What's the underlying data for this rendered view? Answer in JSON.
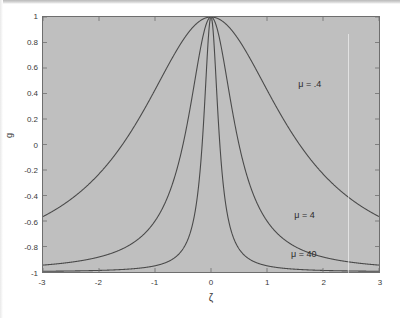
{
  "figure": {
    "background_color": "#ffffff",
    "plot_fill_color": "#bfbfbf",
    "curve_color": "#4a4a4a",
    "axis_color": "#6e6e6e",
    "text_color": "#3a3a3a"
  },
  "chart_data": {
    "type": "line",
    "title": "",
    "subtitle": "",
    "xlabel": "ζ",
    "ylabel": "g",
    "xlim": [
      -3,
      3
    ],
    "ylim": [
      -1,
      1
    ],
    "grid": false,
    "legend_position": "inline-annotations",
    "x_ticks": [
      "-3",
      "-2",
      "-1",
      "0",
      "1",
      "2",
      "3"
    ],
    "x_tick_values": [
      -3,
      -2,
      -1,
      0,
      1,
      2,
      3
    ],
    "y_ticks": [
      "1",
      "0.8",
      "0.6",
      "0.4",
      "0.2",
      "0",
      "-0.2",
      "-0.4",
      "-0.6",
      "-0.8",
      "-1"
    ],
    "y_tick_values": [
      1,
      0.8,
      0.6,
      0.4,
      0.2,
      0,
      -0.2,
      -0.4,
      -0.6,
      -0.8,
      -1
    ],
    "shaded_region": {
      "description": "Grey filled background spanning full axes between g = -1 and g = 1",
      "y_from": -1,
      "y_to": 1
    },
    "annotations": [
      {
        "text": "μ = .4",
        "x": 1.55,
        "y": 0.46
      },
      {
        "text": "μ = 4",
        "x": 1.48,
        "y": -0.56
      },
      {
        "text": "μ = 40",
        "x": 1.42,
        "y": -0.86
      }
    ],
    "formula": "g(ζ) = 2 / (1 + μζ²) − 1",
    "series": [
      {
        "name": "μ = .4",
        "mu": 0.4,
        "x": [
          -3,
          -2.75,
          -2.5,
          -2.25,
          -2,
          -1.75,
          -1.5,
          -1.25,
          -1,
          -0.75,
          -0.5,
          -0.25,
          0,
          0.25,
          0.5,
          0.75,
          1,
          1.25,
          1.5,
          1.75,
          2,
          2.25,
          2.5,
          2.75,
          3
        ],
        "values": [
          0.127,
          0.177,
          0.231,
          0.292,
          0.429,
          0.448,
          0.525,
          0.6,
          0.714,
          0.796,
          0.818,
          0.952,
          1.0,
          0.952,
          0.818,
          0.796,
          0.714,
          0.6,
          0.525,
          0.448,
          0.429,
          0.292,
          0.231,
          0.177,
          0.127
        ]
      },
      {
        "name": "μ = 4",
        "mu": 4,
        "x": [
          -3,
          -2.75,
          -2.5,
          -2.25,
          -2,
          -1.75,
          -1.5,
          -1.25,
          -1,
          -0.75,
          -0.5,
          -0.25,
          0,
          0.25,
          0.5,
          0.75,
          1,
          1.25,
          1.5,
          1.75,
          2,
          2.25,
          2.5,
          2.75,
          3
        ],
        "values": [
          -0.784,
          -0.746,
          -0.72,
          -0.69,
          -0.647,
          -0.6,
          -0.5,
          -0.39,
          -0.2,
          0.032,
          0.0,
          0.6,
          1.0,
          0.6,
          0.0,
          0.032,
          -0.2,
          -0.39,
          -0.5,
          -0.6,
          -0.647,
          -0.69,
          -0.72,
          -0.746,
          -0.784
        ]
      },
      {
        "name": "μ = 40",
        "mu": 40,
        "x": [
          -3,
          -2.5,
          -2,
          -1.5,
          -1.25,
          -1,
          -0.75,
          -0.5,
          -0.375,
          -0.25,
          -0.125,
          0,
          0.125,
          0.25,
          0.375,
          0.5,
          0.75,
          1,
          1.25,
          1.5,
          2,
          2.5,
          3
        ],
        "values": [
          -0.972,
          -0.961,
          -0.95,
          -0.932,
          -0.92,
          -0.902,
          -0.86,
          -0.818,
          -0.75,
          -0.6,
          -0.2,
          1.0,
          -0.2,
          -0.6,
          -0.75,
          -0.818,
          -0.86,
          -0.902,
          -0.92,
          -0.932,
          -0.95,
          -0.961,
          -0.972
        ]
      }
    ]
  }
}
